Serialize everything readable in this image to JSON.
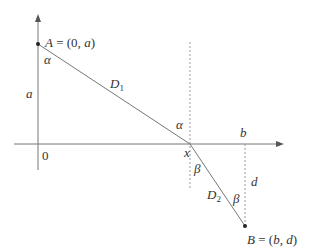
{
  "diagram": {
    "colors": {
      "axis": "#777777",
      "line": "#777777",
      "dashed": "#999999",
      "text": "#333333",
      "point": "#222222"
    },
    "axes": {
      "origin_label": "0"
    },
    "points": {
      "A": {
        "name": "A",
        "eq": " = (0, ",
        "var": "a",
        "close": ")"
      },
      "B": {
        "name": "B",
        "eq": " = (",
        "var1": "b",
        "sep": ", ",
        "var2": "d",
        "close": ")"
      }
    },
    "labels": {
      "a": "a",
      "b": "b",
      "d": "d",
      "x": "x",
      "alpha_top": "α",
      "alpha_mid": "α",
      "beta_top": "β",
      "beta_bottom": "β",
      "D1_main": "D",
      "D1_sub": "1",
      "D2_main": "D",
      "D2_sub": "2"
    }
  }
}
